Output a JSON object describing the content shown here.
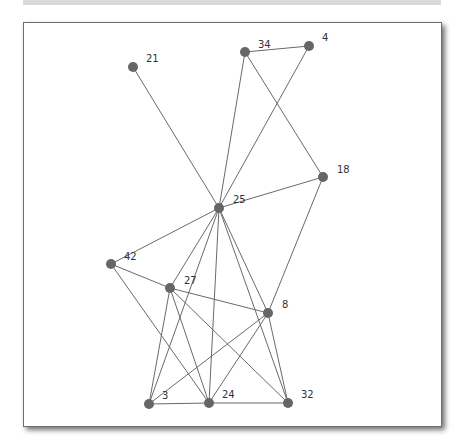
{
  "diagram": {
    "type": "network-graph",
    "colors": {
      "node": "#666666",
      "edge": "#6a6a6a",
      "label": "#333333",
      "frame_border": "#6e6e6e",
      "top_bar": "#d9d9d9"
    },
    "nodes": [
      {
        "id": "21",
        "label": "21",
        "x": 133,
        "y": 67,
        "lx": 146,
        "ly": 62
      },
      {
        "id": "34",
        "label": "34",
        "x": 245,
        "y": 52,
        "lx": 258,
        "ly": 48
      },
      {
        "id": "4",
        "label": "4",
        "x": 309,
        "y": 46,
        "lx": 322,
        "ly": 41
      },
      {
        "id": "18",
        "label": "18",
        "x": 323,
        "y": 177,
        "lx": 337,
        "ly": 173
      },
      {
        "id": "25",
        "label": "25",
        "x": 219,
        "y": 208,
        "lx": 233,
        "ly": 203
      },
      {
        "id": "42",
        "label": "42",
        "x": 111,
        "y": 264,
        "lx": 124,
        "ly": 260
      },
      {
        "id": "27",
        "label": "27",
        "x": 170,
        "y": 288,
        "lx": 184,
        "ly": 284
      },
      {
        "id": "8",
        "label": "8",
        "x": 268,
        "y": 313,
        "lx": 282,
        "ly": 308
      },
      {
        "id": "3",
        "label": "3",
        "x": 149,
        "y": 404,
        "lx": 162,
        "ly": 399
      },
      {
        "id": "24",
        "label": "24",
        "x": 209,
        "y": 403,
        "lx": 222,
        "ly": 398
      },
      {
        "id": "32",
        "label": "32",
        "x": 288,
        "y": 403,
        "lx": 301,
        "ly": 398
      }
    ],
    "edges": [
      [
        "34",
        "4"
      ],
      [
        "34",
        "25"
      ],
      [
        "34",
        "18"
      ],
      [
        "4",
        "25"
      ],
      [
        "21",
        "25"
      ],
      [
        "25",
        "18"
      ],
      [
        "18",
        "8"
      ],
      [
        "25",
        "42"
      ],
      [
        "25",
        "27"
      ],
      [
        "25",
        "3"
      ],
      [
        "25",
        "24"
      ],
      [
        "25",
        "8"
      ],
      [
        "25",
        "32"
      ],
      [
        "42",
        "27"
      ],
      [
        "42",
        "24"
      ],
      [
        "27",
        "8"
      ],
      [
        "27",
        "3"
      ],
      [
        "27",
        "24"
      ],
      [
        "27",
        "32"
      ],
      [
        "8",
        "3"
      ],
      [
        "8",
        "24"
      ],
      [
        "8",
        "32"
      ],
      [
        "3",
        "24"
      ],
      [
        "24",
        "32"
      ]
    ]
  }
}
